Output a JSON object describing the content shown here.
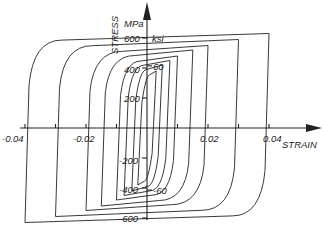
{
  "chart_data": {
    "type": "line",
    "title": "",
    "xlabel": "STRAIN",
    "ylabel": "STRESS",
    "y_units_left": "MPa",
    "y_units_right": "ksi",
    "x_ticks": [
      "-0.04",
      "-0.02",
      "0.02",
      "0.04"
    ],
    "x_tick_values": [
      -0.04,
      -0.03,
      -0.02,
      -0.01,
      0.01,
      0.02,
      0.03,
      0.04
    ],
    "y_ticks_mpa": [
      "600",
      "400",
      "200",
      "-200",
      "-400",
      "-600"
    ],
    "y_ticks_ksi": [
      "60",
      "-60"
    ],
    "xlim": [
      -0.045,
      0.05
    ],
    "ylim": [
      -650,
      700
    ],
    "grid": false,
    "legend": "none",
    "series": [
      {
        "name": "loop 1",
        "strain_amplitude": 0.003,
        "stress_max": 380,
        "stress_min": -380
      },
      {
        "name": "loop 2",
        "strain_amplitude": 0.005,
        "stress_max": 420,
        "stress_min": -420
      },
      {
        "name": "loop 3",
        "strain_amplitude": 0.0075,
        "stress_max": 450,
        "stress_min": -450
      },
      {
        "name": "loop 4",
        "strain_amplitude": 0.01,
        "stress_max": 480,
        "stress_min": -480
      },
      {
        "name": "loop 5",
        "strain_amplitude": 0.015,
        "stress_max": 520,
        "stress_min": -520
      },
      {
        "name": "loop 6",
        "strain_amplitude": 0.02,
        "stress_max": 550,
        "stress_min": -550
      },
      {
        "name": "loop 7",
        "strain_amplitude": 0.03,
        "stress_max": 590,
        "stress_min": -590
      },
      {
        "name": "loop 8",
        "strain_amplitude": 0.04,
        "stress_max": 630,
        "stress_min": -630
      }
    ]
  },
  "labels": {
    "stress": "STRESS",
    "mpa": "MPa",
    "ksi": "ksi",
    "strain": "STRAIN",
    "x_neg_004": "-0.04",
    "x_neg_002": "-0.02",
    "x_pos_002": "0.02",
    "x_pos_004": "0.04",
    "y_600": "600",
    "y_400": "400",
    "y_200": "200",
    "y_neg_200": "-200",
    "y_neg_400": "-400",
    "y_neg_600": "-600",
    "ksi_60": "60",
    "ksi_neg_60": "-60"
  }
}
